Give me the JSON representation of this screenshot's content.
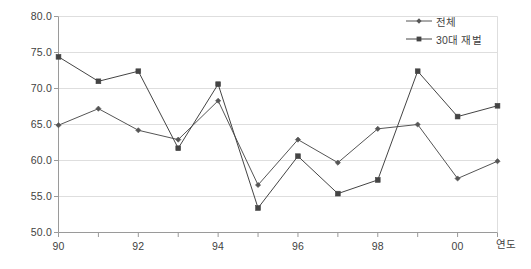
{
  "chart_data": {
    "type": "line",
    "title": "",
    "xlabel": "연도",
    "ylabel": "",
    "ylim": [
      50.0,
      80.0
    ],
    "ytick_step": 5.0,
    "ytick_labels": [
      "80.0",
      "75.0",
      "70.0",
      "65.0",
      "60.0",
      "55.0",
      "50.0"
    ],
    "ytick_values": [
      80.0,
      75.0,
      70.0,
      65.0,
      60.0,
      55.0,
      50.0
    ],
    "grid": true,
    "grid_axis": "y",
    "legend_position": "top-right",
    "x": [
      1990,
      1991,
      1992,
      1993,
      1994,
      1995,
      1996,
      1997,
      1998,
      1999,
      2000,
      2001
    ],
    "categories": [
      "90",
      "91",
      "92",
      "93",
      "94",
      "95",
      "96",
      "97",
      "98",
      "99",
      "00",
      "01"
    ],
    "xtick_labels": [
      "90",
      "92",
      "94",
      "96",
      "98",
      "00"
    ],
    "xtick_label_values": [
      1990,
      1992,
      1994,
      1996,
      1998,
      2000
    ],
    "series": [
      {
        "name": "전체",
        "marker": "diamond",
        "color": "#555555",
        "values": [
          64.9,
          67.2,
          64.2,
          62.9,
          68.3,
          56.6,
          62.9,
          59.7,
          64.4,
          65.0,
          57.5,
          59.9
        ]
      },
      {
        "name": "30대 재벌",
        "marker": "square",
        "color": "#444444",
        "values": [
          74.4,
          71.0,
          72.4,
          61.7,
          70.6,
          53.4,
          60.6,
          55.4,
          57.3,
          72.4,
          66.1,
          67.6
        ]
      }
    ]
  },
  "colors": {
    "background": "#ffffff",
    "axis": "#9a9a9a",
    "grid": "#dedede",
    "text": "#3f3f3f",
    "series_total": "#555555",
    "series_chaebol": "#444444"
  },
  "axis_title": {
    "x": "연도"
  }
}
